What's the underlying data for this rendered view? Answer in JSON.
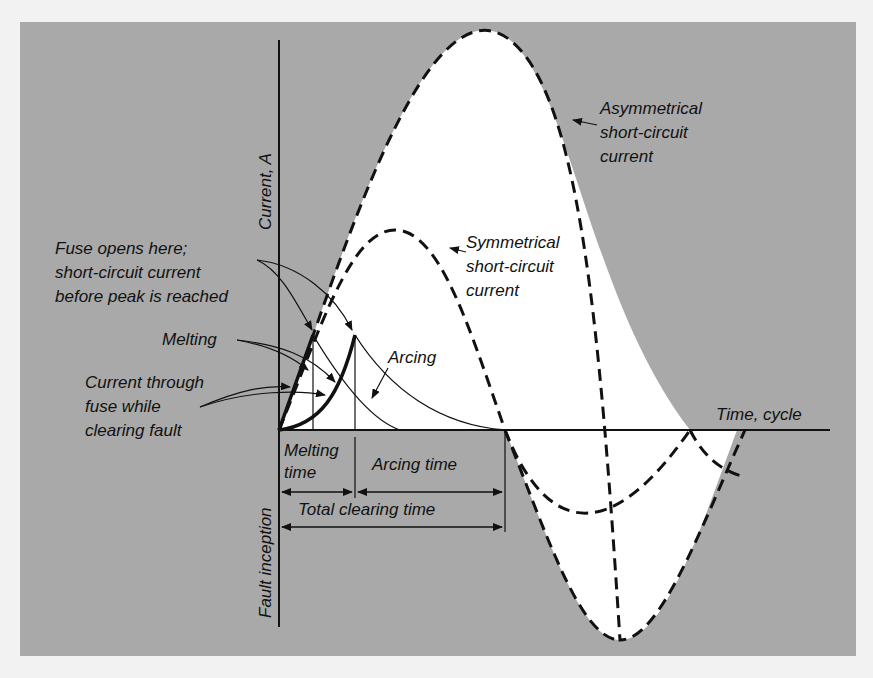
{
  "figure": {
    "y_axis_label": "Current, A",
    "x_axis_label": "Time, cycle",
    "fault_inception_label": "Fault inception",
    "annotations": {
      "fuse_opens": [
        "Fuse opens here;",
        "short-circuit current",
        "before peak is reached"
      ],
      "melting": "Melting",
      "current_through_fuse": [
        "Current through",
        "fuse while",
        "clearing fault"
      ],
      "arcing": "Arcing",
      "symmetrical": [
        "Symmetrical",
        "short-circuit",
        "current"
      ],
      "asymmetrical": [
        "Asymmetrical",
        "short-circuit",
        "current"
      ]
    },
    "time_spans": {
      "melting_time": [
        "Melting",
        "time"
      ],
      "arcing_time": "Arcing time",
      "total_clearing_time": "Total clearing time"
    },
    "colors": {
      "panel": "#a9a9a9",
      "curve_fill": "#ffffff",
      "ink": "#111111"
    }
  }
}
